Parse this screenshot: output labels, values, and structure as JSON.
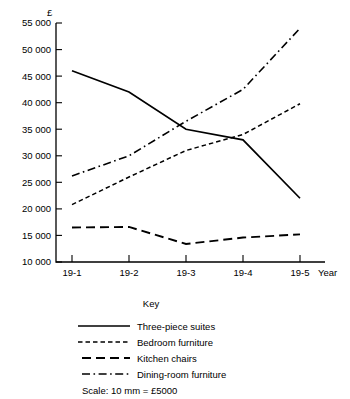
{
  "chart_data": {
    "type": "line",
    "title": "",
    "xlabel": "Year",
    "ylabel": "£",
    "currency_symbol": "£",
    "categories": [
      "19-1",
      "19-2",
      "19-3",
      "19-4",
      "19-5"
    ],
    "ylim": [
      10000,
      55000
    ],
    "ytick_step": 5000,
    "ytick_labels": [
      "10 000",
      "15 000",
      "20 000",
      "25 000",
      "30 000",
      "35 000",
      "40 000",
      "45 000",
      "50 000",
      "55 000"
    ],
    "ytick_values": [
      10000,
      15000,
      20000,
      25000,
      30000,
      35000,
      40000,
      45000,
      50000,
      55000
    ],
    "grid": false,
    "legend_position": "below",
    "series": [
      {
        "name": "Three-piece suites",
        "style": "solid",
        "values": [
          46000,
          42000,
          35000,
          33000,
          22000
        ]
      },
      {
        "name": "Bedroom furniture",
        "style": "fine-dashed",
        "values": [
          20800,
          26000,
          31000,
          34000,
          39800
        ]
      },
      {
        "name": "Kitchen chairs",
        "style": "long-dashed",
        "values": [
          16500,
          16600,
          13400,
          14600,
          15200
        ]
      },
      {
        "name": "Dining-room furniture",
        "style": "dash-dot",
        "values": [
          26200,
          30000,
          36500,
          42500,
          54000
        ]
      }
    ]
  },
  "key": {
    "title": "Key",
    "entries": [
      {
        "label": "Three-piece suites",
        "style": "solid"
      },
      {
        "label": "Bedroom furniture",
        "style": "fine-dashed"
      },
      {
        "label": "Kitchen chairs",
        "style": "long-dashed"
      },
      {
        "label": "Dining-room furniture",
        "style": "dash-dot"
      }
    ]
  },
  "scale_note": "Scale: 10 mm = £5000"
}
